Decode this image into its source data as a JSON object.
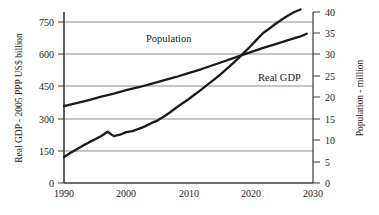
{
  "chart_data": {
    "type": "line",
    "title": "",
    "subtitle": "",
    "xlabel": "",
    "xlim": [
      1990,
      2030
    ],
    "xticks": [
      1990,
      2000,
      2010,
      2020,
      2030
    ],
    "xtick_labels": [
      "1990",
      "2000",
      "2010",
      "2020",
      "2030"
    ],
    "grid": true,
    "grid_axis": "y",
    "legend_position": "inline-annotations",
    "axes": [
      {
        "id": "left",
        "label": "Real GDP - 2005 PPP US$ billion",
        "ylim": [
          0,
          800
        ],
        "ticks": [
          0,
          150,
          300,
          450,
          600,
          750
        ],
        "tick_labels": [
          "0",
          "150",
          "300",
          "450",
          "600",
          "750"
        ]
      },
      {
        "id": "right",
        "label": "Population - million",
        "ylim": [
          0,
          40
        ],
        "ticks": [
          0,
          5,
          10,
          15,
          20,
          25,
          30,
          35,
          40
        ],
        "tick_labels": [
          "0",
          "5",
          "10",
          "15",
          "20",
          "25",
          "30",
          "35",
          "40"
        ]
      }
    ],
    "series": [
      {
        "name": "Real GDP",
        "axis": "left",
        "unit": "2005 PPP US$ billion",
        "color": "#1a1a1a",
        "annotation": "Real GDP",
        "x": [
          1990,
          1991,
          1992,
          1993,
          1994,
          1995,
          1996,
          1997,
          1998,
          1999,
          2000,
          2001,
          2002,
          2003,
          2004,
          2005,
          2006,
          2007,
          2008,
          2009,
          2010,
          2011,
          2012,
          2013,
          2014,
          2015,
          2016,
          2017,
          2018,
          2019,
          2020,
          2021,
          2022,
          2023,
          2024,
          2025,
          2026,
          2027,
          2028
        ],
        "values": [
          122,
          140,
          157,
          174,
          190,
          205,
          220,
          240,
          219,
          226,
          238,
          243,
          253,
          265,
          280,
          292,
          310,
          330,
          352,
          372,
          392,
          414,
          436,
          459,
          481,
          505,
          530,
          556,
          583,
          612,
          641,
          672,
          702,
          723,
          745,
          765,
          784,
          800,
          812
        ]
      },
      {
        "name": "Population",
        "axis": "right",
        "unit": "million",
        "color": "#1a1a1a",
        "annotation": "Population",
        "x": [
          1990,
          1992,
          1994,
          1996,
          1998,
          2000,
          2002,
          2004,
          2006,
          2008,
          2010,
          2012,
          2014,
          2016,
          2018,
          2020,
          2022,
          2024,
          2026,
          2028,
          2029
        ],
        "values": [
          18.0,
          18.7,
          19.4,
          20.2,
          20.9,
          21.7,
          22.4,
          23.2,
          24.0,
          24.8,
          25.7,
          26.6,
          27.6,
          28.6,
          29.6,
          30.6,
          31.6,
          32.5,
          33.4,
          34.3,
          34.9
        ]
      }
    ],
    "annotations": [
      {
        "text": "Population",
        "x_year": 2003,
        "axis_value_left": 710
      },
      {
        "text": "Real GDP",
        "x_year": 2020.5,
        "axis_value_left": 500
      }
    ]
  },
  "colors": {
    "background": "#ffffff",
    "line": "#1a1a1a",
    "gridline": "#8c8c8c",
    "spine": "#3a3a3a",
    "text": "#1a1a1a"
  }
}
